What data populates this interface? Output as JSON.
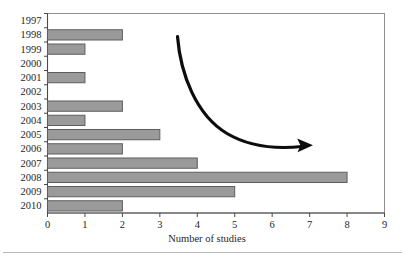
{
  "chart_data": {
    "type": "bar",
    "orientation": "horizontal",
    "title": "",
    "xlabel": "Number of studies",
    "ylabel": "",
    "categories": [
      "1997",
      "1998",
      "1999",
      "2000",
      "2001",
      "2002",
      "2003",
      "2004",
      "2005",
      "2006",
      "2007",
      "2008",
      "2009",
      "2010"
    ],
    "values": [
      0,
      2,
      1,
      0,
      1,
      0,
      2,
      1,
      3,
      2,
      4,
      8,
      5,
      2
    ],
    "xlim": [
      0,
      9
    ],
    "xticks": [
      "0",
      "1",
      "2",
      "3",
      "4",
      "5",
      "6",
      "7",
      "8",
      "9"
    ],
    "grid": false,
    "legend": null,
    "bar_color": "#9a9a9a",
    "bar_border_color": "#5e5e5e",
    "annotations": [
      {
        "name": "downward-trend-arrow",
        "type": "curved-arrow",
        "description": "Black curved arrow sweeping from upper-left down to the right",
        "color": "#0d0d0d"
      }
    ]
  },
  "figure": {
    "background": "#ffffff",
    "frame_color": "#8e8e8e"
  }
}
